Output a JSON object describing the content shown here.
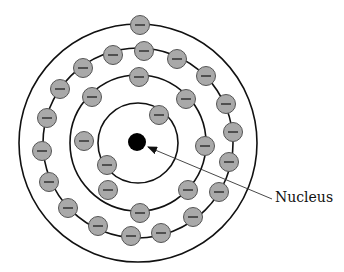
{
  "diagram": {
    "type": "atom-shell-model",
    "center": [
      138,
      143
    ],
    "colors": {
      "electron_fill": "#a9a9a9",
      "electron_stroke": "#555555",
      "nucleus": "#000000",
      "orbit": "#111111"
    },
    "nucleus": {
      "cx": 137,
      "cy": 142,
      "r": 9
    },
    "orbits": [
      {
        "name": "shell-1",
        "r": 40
      },
      {
        "name": "shell-2",
        "r": 68
      },
      {
        "name": "shell-3",
        "r": 95
      },
      {
        "name": "shell-4",
        "r": 119
      }
    ],
    "electron_symbol": "−",
    "electron_radius": 9.5,
    "shells": [
      {
        "name": "shell-1",
        "count": 2,
        "electrons": [
          [
            159,
            115
          ],
          [
            107,
            165
          ]
        ]
      },
      {
        "name": "shell-2",
        "count": 8,
        "electrons": [
          [
            139,
            77
          ],
          [
            92,
            97
          ],
          [
            84,
            141
          ],
          [
            108,
            190
          ],
          [
            140,
            213
          ],
          [
            188,
            190
          ],
          [
            205,
            146
          ],
          [
            186,
            99
          ]
        ]
      },
      {
        "name": "shell-3",
        "count": 18,
        "electrons": [
          [
            83,
            68
          ],
          [
            113,
            55
          ],
          [
            144,
            51
          ],
          [
            177,
            59
          ],
          [
            206,
            76
          ],
          [
            226,
            104
          ],
          [
            233,
            132
          ],
          [
            229,
            162
          ],
          [
            219,
            192
          ],
          [
            193,
            217
          ],
          [
            161,
            233
          ],
          [
            131,
            236
          ],
          [
            98,
            226
          ],
          [
            68,
            208
          ],
          [
            49,
            182
          ],
          [
            42,
            151
          ],
          [
            47,
            118
          ],
          [
            60,
            89
          ]
        ]
      },
      {
        "name": "shell-4",
        "count": 1,
        "electrons": [
          [
            140,
            25
          ]
        ]
      }
    ],
    "label": {
      "text": "Nucleus",
      "pointer_from": [
        272,
        199
      ],
      "pointer_to": [
        148,
        147
      ]
    }
  }
}
